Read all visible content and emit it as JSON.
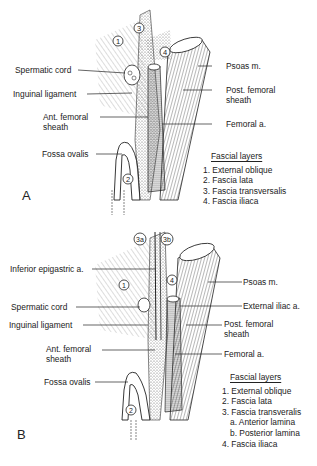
{
  "figure": {
    "panels": [
      {
        "id": "A",
        "letter": "A",
        "left_labels": {
          "spermatic_cord": "Spermatic cord",
          "inguinal_ligament": "Inguinal ligament",
          "ant_femoral_sheath_1": "Ant. femoral",
          "ant_femoral_sheath_2": "sheath",
          "fossa_ovalis": "Fossa ovalis"
        },
        "right_labels": {
          "psoas": "Psoas m.",
          "post_femoral_sheath_1": "Post. femoral",
          "post_femoral_sheath_2": "sheath",
          "femoral_a": "Femoral a."
        },
        "markers": [
          "1",
          "2",
          "3",
          "4"
        ],
        "legend": {
          "title": "Fascial layers",
          "items": [
            "1.  External oblique",
            "2.  Fascia lata",
            "3.  Fascia transversalis",
            "4.  Fascia iliaca"
          ]
        }
      },
      {
        "id": "B",
        "letter": "B",
        "left_labels": {
          "inferior_epigastric": "Inferior epigastric a.",
          "spermatic_cord": "Spermatic cord",
          "inguinal_ligament": "Inguinal ligament",
          "ant_femoral_sheath_1": "Ant. femoral",
          "ant_femoral_sheath_2": "sheath",
          "fossa_ovalis": "Fossa ovalis"
        },
        "right_labels": {
          "psoas": "Psoas m.",
          "external_iliac": "External iliac a.",
          "post_femoral_sheath_1": "Post. femoral",
          "post_femoral_sheath_2": "sheath",
          "femoral_a": "Femoral a."
        },
        "markers": [
          "1",
          "2",
          "3a",
          "3b",
          "4"
        ],
        "legend": {
          "title": "Fascial layers",
          "items": [
            "1. External oblique",
            "2. Fascia lata",
            "3. Fascia transveralis",
            "a. Anterior lamina",
            "b. Posterior lamina",
            "4. Fascia iliaca"
          ]
        }
      }
    ]
  }
}
